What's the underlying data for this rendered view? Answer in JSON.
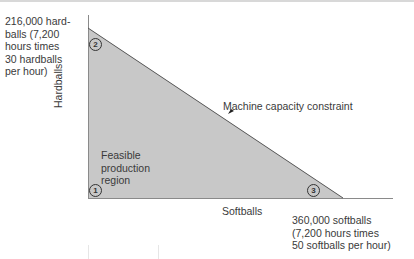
{
  "diagram": {
    "type": "linear-programming-feasible-region",
    "axes": {
      "x_label": "Softballs",
      "y_label": "Hardballs"
    },
    "intercepts": {
      "y": "216,000 hard-\nballs (7,200\nhours times\n30 hardballs\nper hour)",
      "x": "360,000 softballs\n(7,200 hours times\n50 softballs per hour)"
    },
    "constraint_label": "Machine capacity constraint",
    "region_label": "Feasible\nproduction\nregion",
    "corner_points": [
      {
        "id": "1",
        "label": "1",
        "position": "origin"
      },
      {
        "id": "2",
        "label": "2",
        "position": "y-intercept"
      },
      {
        "id": "3",
        "label": "3",
        "position": "x-intercept"
      }
    ],
    "colors": {
      "region_fill": "#c8c8c8",
      "axis": "#8a8a8a",
      "constraint_line": "#555555",
      "text": "#3a3a3a"
    }
  }
}
